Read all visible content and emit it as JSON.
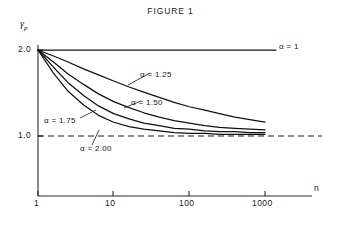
{
  "figure": {
    "title": "FIGURE 1"
  },
  "axes": {
    "ylabel": "γ",
    "ylabel_sub": "p",
    "xlabel": "n",
    "yticks": [
      "2.0",
      "1.0"
    ],
    "xticks": [
      "1",
      "10",
      "100",
      "1000"
    ]
  },
  "series_labels": {
    "alpha_1": "α = 1",
    "alpha_125": "α = 1.25",
    "alpha_150": "α = 1.50",
    "alpha_175": "α = 1.75",
    "alpha_200": "α = 2.00"
  },
  "colors": {
    "curve": "#111111",
    "axis": "#2a2a2a",
    "background": "#ffffff"
  },
  "chart_data": {
    "type": "line",
    "title": "FIGURE 1",
    "xlabel": "n",
    "ylabel": "γ_p",
    "xscale": "log",
    "xlim": [
      1,
      1000
    ],
    "ylim": [
      0,
      2.0
    ],
    "grid": false,
    "legend_position": "inline-annotations",
    "xticks": [
      1,
      10,
      100,
      1000
    ],
    "yticks": [
      1.0,
      2.0
    ],
    "reference_line": {
      "y": 1.0,
      "style": "dashed",
      "label": "1.0"
    },
    "x": [
      1,
      1.6,
      2.5,
      4,
      6.3,
      10,
      16,
      25,
      40,
      63,
      100,
      160,
      250,
      400,
      630,
      1000
    ],
    "series": [
      {
        "name": "α = 1",
        "alpha": 1.0,
        "values": [
          2.0,
          2.0,
          2.0,
          2.0,
          2.0,
          2.0,
          2.0,
          2.0,
          2.0,
          2.0,
          2.0,
          2.0,
          2.0,
          2.0,
          2.0,
          2.0
        ]
      },
      {
        "name": "α = 1.25",
        "alpha": 1.25,
        "values": [
          2.0,
          1.93,
          1.86,
          1.78,
          1.71,
          1.64,
          1.57,
          1.51,
          1.45,
          1.39,
          1.34,
          1.3,
          1.26,
          1.22,
          1.19,
          1.16
        ]
      },
      {
        "name": "α = 1.50",
        "alpha": 1.5,
        "values": [
          2.0,
          1.86,
          1.72,
          1.6,
          1.49,
          1.4,
          1.33,
          1.27,
          1.22,
          1.18,
          1.15,
          1.12,
          1.1,
          1.09,
          1.08,
          1.07
        ]
      },
      {
        "name": "α = 1.75",
        "alpha": 1.75,
        "values": [
          2.0,
          1.8,
          1.62,
          1.47,
          1.35,
          1.26,
          1.2,
          1.15,
          1.12,
          1.09,
          1.08,
          1.06,
          1.05,
          1.05,
          1.04,
          1.04
        ]
      },
      {
        "name": "α = 2.00",
        "alpha": 2.0,
        "values": [
          2.0,
          1.73,
          1.52,
          1.36,
          1.24,
          1.16,
          1.11,
          1.08,
          1.06,
          1.04,
          1.03,
          1.03,
          1.02,
          1.02,
          1.02,
          1.02
        ]
      }
    ]
  }
}
